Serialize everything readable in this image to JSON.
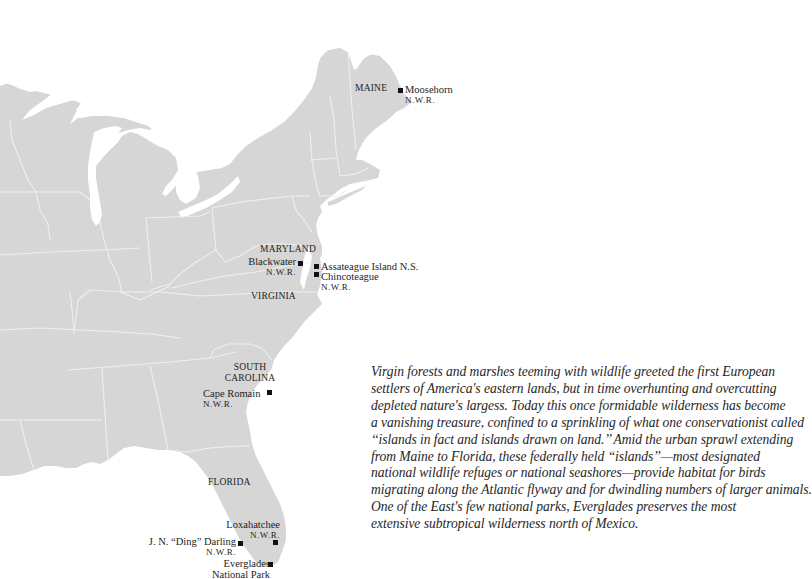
{
  "map": {
    "land_color": "#d6d6d6",
    "border_color": "#efefef",
    "water_color": "#ffffff",
    "states": {
      "maine": "MAINE",
      "maryland": "MARYLAND",
      "virginia": "VIRGINIA",
      "south_carolina_line1": "SOUTH",
      "south_carolina_line2": "CAROLINA",
      "florida": "FLORIDA"
    },
    "sites": [
      {
        "name": "Moosehorn",
        "designation": "N.W.R."
      },
      {
        "name": "Blackwater",
        "designation": "N.W.R."
      },
      {
        "name": "Assateague Island N.S.",
        "designation": ""
      },
      {
        "name": "Chincoteague",
        "designation": "N.W.R."
      },
      {
        "name": "Cape Romain",
        "designation": "N.W.R."
      },
      {
        "name": "Loxahatchee",
        "designation": "N.W.R."
      },
      {
        "name": "J. N. “Ding” Darling",
        "designation": "N.W.R."
      },
      {
        "name": "Everglades",
        "designation": "National Park"
      }
    ],
    "marker_color": "#111111"
  },
  "caption": {
    "lines": [
      "Virgin forests and marshes teeming with wildlife greeted the first European",
      "settlers of America's eastern lands, but in time overhunting and overcutting",
      "depleted nature's largess. Today this once formidable wilderness has become",
      "a vanishing treasure, confined to a sprinkling of what one conservationist called",
      "‘‘islands in fact and islands drawn on land.’’ Amid the urban sprawl extending",
      "from Maine to Florida, these federally held ‘‘islands’’—most designated",
      "national wildlife refuges or national seashores—provide habitat for birds",
      "migrating along the Atlantic flyway and for dwindling numbers of larger animals.",
      "One of the East's few national parks, Everglades preserves the most",
      "extensive subtropical wilderness north of Mexico."
    ]
  }
}
